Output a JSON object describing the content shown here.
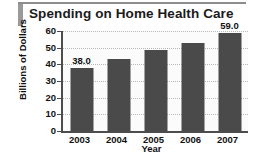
{
  "chart_data": {
    "type": "bar",
    "title": "Spending on Home Health Care",
    "xlabel": "Year",
    "ylabel": "Billions of Dollars",
    "categories": [
      "2003",
      "2004",
      "2005",
      "2006",
      "2007"
    ],
    "values": [
      38.0,
      43.0,
      48.5,
      53.0,
      59.0
    ],
    "data_labels": [
      "38.0",
      "",
      "",
      "",
      "59.0"
    ],
    "ylim": [
      0,
      60
    ],
    "yticks": [
      0,
      10,
      20,
      30,
      40,
      50,
      60
    ],
    "ytick_labels": [
      "0",
      "10",
      "20",
      "30",
      "40",
      "50",
      "60"
    ],
    "grid": true,
    "legend": "none",
    "bar_color": "#4a4a4a",
    "plot_background": "#fbfbfb",
    "axis_color": "#4d4d4d",
    "gridline_color": "#b9b9b9",
    "title_accent_color": "#9a9a9a",
    "text_color": "#111111"
  }
}
